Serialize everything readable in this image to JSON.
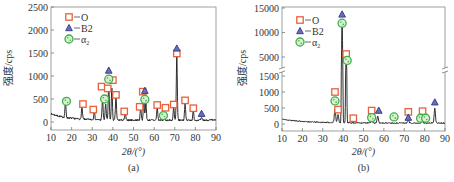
{
  "colors": {
    "o_marker": "#e8603c",
    "b2_marker": "#3a3f8f",
    "a2_marker": "#3fae49",
    "line": "#1a1a1a"
  },
  "chart_data": [
    {
      "type": "line",
      "panel_label": "(a)",
      "xlabel": "2θ/(°)",
      "ylabel": "强度/cps",
      "xlim": [
        10,
        90
      ],
      "ylim": [
        -100,
        2500
      ],
      "xticks": [
        10,
        20,
        30,
        40,
        50,
        60,
        70,
        80,
        90
      ],
      "yticks": [
        0,
        500,
        1000,
        1500,
        2000,
        2500
      ],
      "legend": [
        "O",
        "B2",
        "α2"
      ],
      "legend_position": "upper left",
      "peaks": [
        [
          17,
          320
        ],
        [
          25,
          260
        ],
        [
          31,
          200
        ],
        [
          35,
          450
        ],
        [
          36.5,
          350
        ],
        [
          38,
          750
        ],
        [
          39.5,
          700
        ],
        [
          41.5,
          500
        ],
        [
          46,
          150
        ],
        [
          53.5,
          280
        ],
        [
          55,
          550
        ],
        [
          56,
          400
        ],
        [
          61.5,
          300
        ],
        [
          65,
          60
        ],
        [
          69.5,
          280
        ],
        [
          71,
          1400
        ],
        [
          75,
          350
        ],
        [
          79,
          200
        ],
        [
          83,
          50
        ]
      ],
      "markers": {
        "O": [
          [
            25.5,
            390
          ],
          [
            30.5,
            270
          ],
          [
            34.5,
            770
          ],
          [
            37.5,
            730
          ],
          [
            40,
            910
          ],
          [
            41.5,
            590
          ],
          [
            45.5,
            230
          ],
          [
            53,
            330
          ],
          [
            54.5,
            660
          ],
          [
            61.5,
            370
          ],
          [
            65.5,
            310
          ],
          [
            69.5,
            380
          ],
          [
            71,
            1490
          ],
          [
            75,
            470
          ],
          [
            79,
            300
          ]
        ],
        "B2": [
          [
            38,
            1120
          ],
          [
            55.5,
            680
          ],
          [
            71,
            1600
          ],
          [
            83,
            180
          ]
        ],
        "a2": [
          [
            17.5,
            450
          ],
          [
            36,
            500
          ],
          [
            38,
            930
          ],
          [
            55.5,
            490
          ],
          [
            64.5,
            140
          ]
        ]
      }
    },
    {
      "type": "line",
      "panel_label": "(b)",
      "xlabel": "2θ/(°)",
      "ylabel": "强度/cps",
      "xlim": [
        10,
        90
      ],
      "ylim_lower": [
        -100,
        1700
      ],
      "ylim_upper": [
        3500,
        15000
      ],
      "axis_break": true,
      "xticks": [
        10,
        20,
        30,
        40,
        50,
        60,
        70,
        80,
        90
      ],
      "yticks": [
        0,
        500,
        1000,
        1500,
        5000,
        10000,
        15000
      ],
      "legend": [
        "O",
        "B2",
        "α2"
      ],
      "legend_position": "upper left",
      "peaks": [
        [
          36,
          450
        ],
        [
          37.5,
          250
        ],
        [
          39.5,
          13000
        ],
        [
          41.5,
          4500
        ],
        [
          54,
          80
        ],
        [
          57,
          200
        ],
        [
          72,
          100
        ],
        [
          79,
          60
        ],
        [
          85,
          450
        ]
      ],
      "markers": {
        "O": [
          [
            36,
            1000
          ],
          [
            37.5,
            450
          ],
          [
            41.5,
            5600
          ],
          [
            45,
            180
          ],
          [
            54,
            420
          ],
          [
            72,
            380
          ],
          [
            79,
            400
          ]
        ],
        "B2": [
          [
            39.5,
            13700
          ],
          [
            57.5,
            420
          ],
          [
            72,
            200
          ],
          [
            85,
            680
          ]
        ],
        "a2": [
          [
            36,
            720
          ],
          [
            39.5,
            11900
          ],
          [
            42,
            4300
          ],
          [
            54,
            200
          ],
          [
            65,
            220
          ],
          [
            78,
            180
          ],
          [
            80.5,
            180
          ]
        ]
      }
    }
  ]
}
